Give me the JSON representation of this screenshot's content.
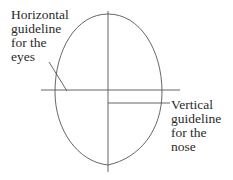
{
  "diagram": {
    "labels": {
      "eyes": "Horizontal\nguideline\nfor the\neyes",
      "nose": "Vertical\nguideline\nfor the\nnose"
    },
    "colors": {
      "stroke": "#555555",
      "text": "#2a2a2a",
      "background": "#ffffff"
    }
  }
}
